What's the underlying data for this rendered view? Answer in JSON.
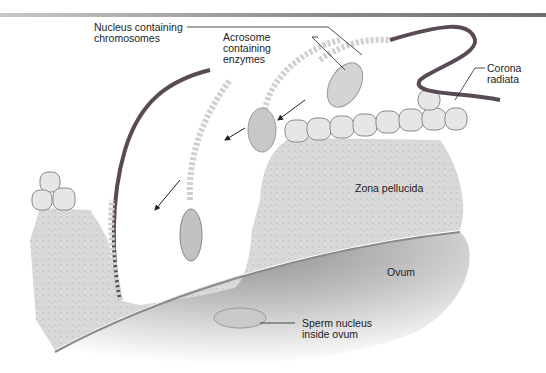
{
  "diagram": {
    "type": "anatomical illustration",
    "labels": {
      "nucleus": "Nucleus containing\nchromosomes",
      "acrosome": "Acrosome\ncontaining\nenzymes",
      "corona": "Corona\nradiata",
      "zona": "Zona pellucida",
      "ovum": "Ovum",
      "sperm_nucleus": "Sperm nucleus\ninside ovum"
    },
    "colors": {
      "background": "#ffffff",
      "zona": "#d6d6d6",
      "ovum_shadow": "#9a9a9a",
      "tail_dark": "#5a4a55",
      "sperm_body": "#cfcfcf",
      "leader_line": "#222222"
    }
  }
}
